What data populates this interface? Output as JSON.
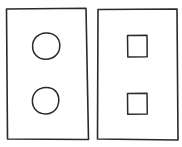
{
  "colors": {
    "background": "#ffffff",
    "stroke": "#2a2a2a"
  },
  "panels": [
    {
      "id": "left-panel",
      "shape": "circle",
      "items": [
        {
          "shape": "circle",
          "position": "top"
        },
        {
          "shape": "circle",
          "position": "bottom"
        }
      ]
    },
    {
      "id": "right-panel",
      "shape": "square",
      "items": [
        {
          "shape": "square",
          "position": "top"
        },
        {
          "shape": "square",
          "position": "bottom"
        }
      ]
    }
  ]
}
